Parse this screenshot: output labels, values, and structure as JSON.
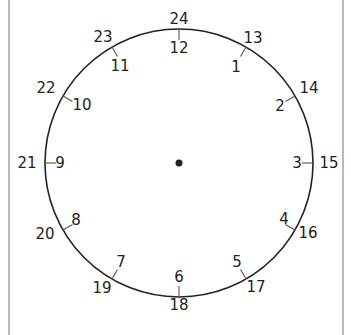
{
  "clock": {
    "type": "24-hour clock face",
    "center": [
      179,
      163
    ],
    "radius": 134,
    "colors": {
      "stroke": "#222222",
      "text": "#222222",
      "frame": "#b8b8b8",
      "background": "#ffffff"
    },
    "outer_labels": [
      "24",
      "13",
      "14",
      "15",
      "16",
      "17",
      "18",
      "19",
      "20",
      "21",
      "22",
      "23"
    ],
    "inner_labels": [
      "12",
      "1",
      "2",
      "3",
      "4",
      "5",
      "6",
      "7",
      "8",
      "9",
      "10",
      "11"
    ]
  },
  "labels": {
    "outer": [
      {
        "text": "24",
        "x": 179,
        "y": 19
      },
      {
        "text": "13",
        "x": 253,
        "y": 38
      },
      {
        "text": "14",
        "x": 309,
        "y": 88
      },
      {
        "text": "15",
        "x": 330,
        "y": 163
      },
      {
        "text": "16",
        "x": 307,
        "y": 233
      },
      {
        "text": "17",
        "x": 256,
        "y": 287
      },
      {
        "text": "18",
        "x": 179,
        "y": 305
      },
      {
        "text": "19",
        "x": 103,
        "y": 288
      },
      {
        "text": "20",
        "x": 46,
        "y": 234
      },
      {
        "text": "21",
        "x": 26,
        "y": 163
      },
      {
        "text": "22",
        "x": 45,
        "y": 88
      },
      {
        "text": "23",
        "x": 103,
        "y": 37
      }
    ],
    "inner": [
      {
        "text": "12",
        "x": 179,
        "y": 48
      },
      {
        "text": "1",
        "x": 236,
        "y": 67
      },
      {
        "text": "2",
        "x": 281,
        "y": 106
      },
      {
        "text": "3",
        "x": 297,
        "y": 163
      },
      {
        "text": "4",
        "x": 286,
        "y": 220
      },
      {
        "text": "5",
        "x": 237,
        "y": 262
      },
      {
        "text": "6",
        "x": 179,
        "y": 277
      },
      {
        "text": "7",
        "x": 121,
        "y": 262
      },
      {
        "text": "8",
        "x": 77,
        "y": 220
      },
      {
        "text": "9",
        "x": 60,
        "y": 163
      },
      {
        "text": "10",
        "x": 81,
        "y": 105
      },
      {
        "text": "11",
        "x": 119,
        "y": 66
      }
    ]
  }
}
